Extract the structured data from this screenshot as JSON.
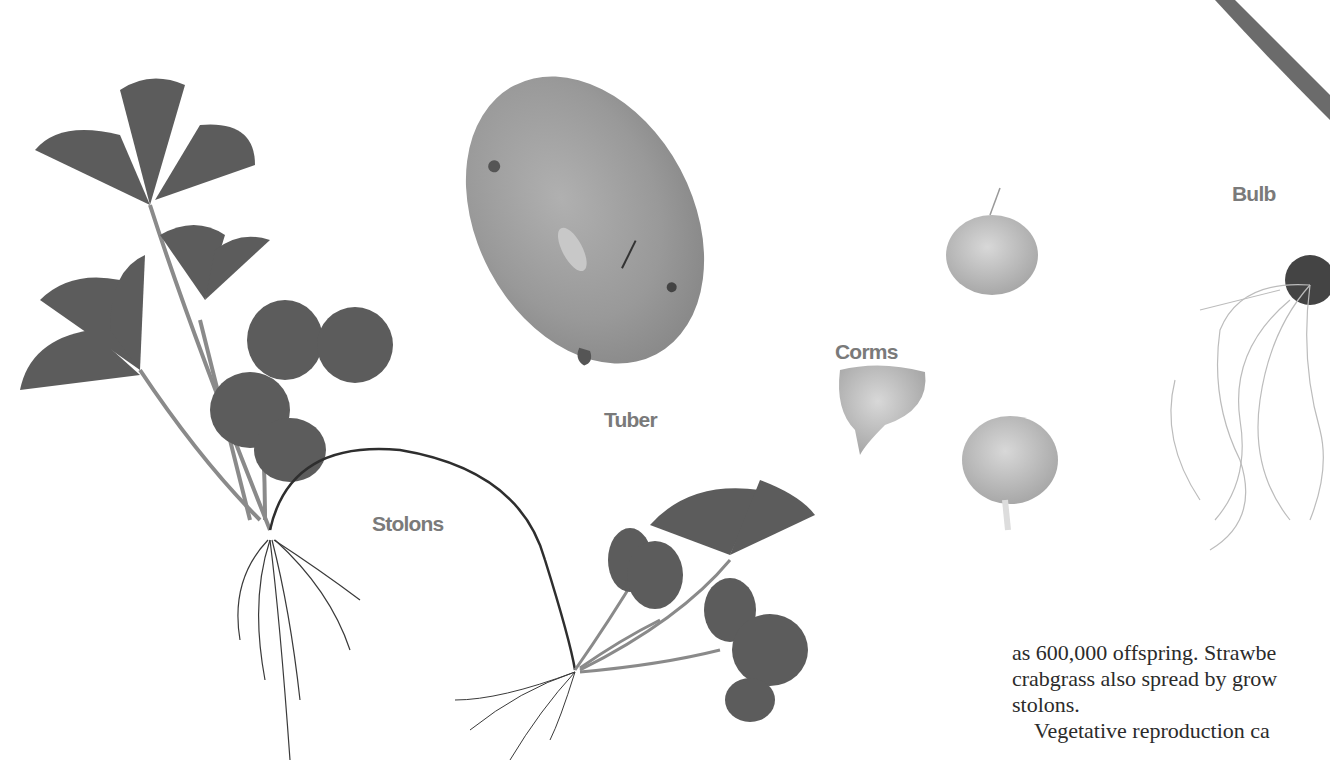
{
  "figure": {
    "labels": {
      "tuber": "Tuber",
      "stolons": "Stolons",
      "corms": "Corms",
      "bulb": "Bulb"
    },
    "specimens": [
      "strawberry-parent-plant",
      "potato-tuber",
      "strawberry-daughter-plant",
      "corm-1",
      "corm-2",
      "corm-3",
      "bulb-with-roots",
      "leaf-blade"
    ],
    "colors": {
      "label": "#7a7a7a",
      "leaf": "#555555",
      "tuber": "#9a9a9a",
      "text": "#2b2b2b",
      "background": "#ffffff"
    }
  },
  "body_text": {
    "line1": "as 600,000 offspring. Strawbe",
    "line2": "crabgrass also spread by grow",
    "line3": "stolons.",
    "line4": "Vegetative reproduction ca"
  }
}
